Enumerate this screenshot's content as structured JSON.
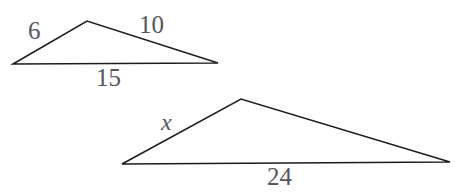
{
  "figure": {
    "kind": "similar-triangles-diagram",
    "background_color": "#ffffff",
    "stroke_color": "#1c1c1c",
    "label_color": "#55555a",
    "width": 460,
    "height": 192
  },
  "triangle_small": {
    "name": "triangle-1",
    "vertices": {
      "left": {
        "x": 13,
        "y": 64
      },
      "apex": {
        "x": 87,
        "y": 21
      },
      "right": {
        "x": 218,
        "y": 63
      }
    },
    "labels": {
      "left_side": "6",
      "right_side": "10",
      "base": "15"
    }
  },
  "triangle_large": {
    "name": "triangle-2",
    "vertices": {
      "left": {
        "x": 122,
        "y": 164
      },
      "apex": {
        "x": 241,
        "y": 99
      },
      "right": {
        "x": 450,
        "y": 162
      }
    },
    "labels": {
      "left_side": "x",
      "base": "24"
    }
  }
}
